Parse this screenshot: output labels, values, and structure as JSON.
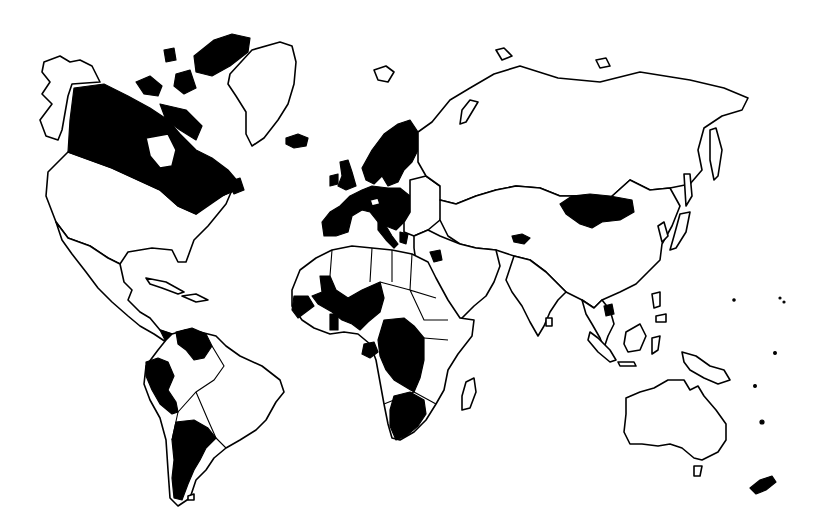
{
  "map": {
    "type": "choropleth-binary",
    "projection": "Mercator-like world outline",
    "colors": {
      "highlighted": "#000000",
      "other": "#ffffff",
      "outline": "#000000",
      "background": "#ffffff"
    },
    "legend": "",
    "title": "",
    "highlighted_regions": [
      "Canada",
      "Canadian Arctic Archipelago",
      "Iceland",
      "United Kingdom",
      "Ireland",
      "Norway",
      "Sweden",
      "Finland",
      "France",
      "Spain",
      "Portugal",
      "Germany",
      "Netherlands",
      "Belgium",
      "Switzerland",
      "Austria",
      "Italy",
      "Poland",
      "Czech Republic",
      "Denmark",
      "Estonia",
      "Greece",
      "Jordan",
      "Kyrgyzstan",
      "Mongolia",
      "Cambodia",
      "New Zealand",
      "Senegal",
      "Mali",
      "Niger",
      "Burkina Faso",
      "Guinea",
      "Ghana",
      "Gabon",
      "Democratic Republic of the Congo",
      "South Africa",
      "Panama",
      "Venezuela",
      "Ecuador",
      "Peru",
      "Argentina"
    ],
    "non_highlighted_labels": [
      "United States",
      "Greenland",
      "Russia",
      "China",
      "India",
      "Brazil",
      "Australia",
      "Madagascar",
      "Saudi Arabia",
      "Alaska"
    ]
  }
}
